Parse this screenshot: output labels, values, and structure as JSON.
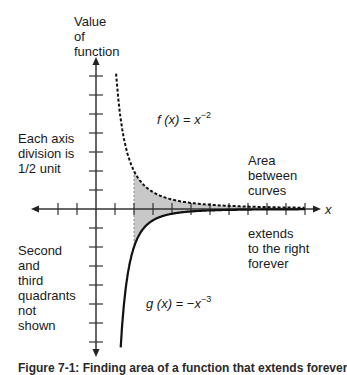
{
  "labels": {
    "y_axis_title": "Value\nof\nfunction",
    "scale_note": "Each axis\ndivision is\n1/2 unit",
    "area_note": "Area\nbetween\ncurves",
    "extends_note": "extends\nto the right\nforever",
    "quadrant_note": "Second\nand\nthird\nquadrants\nnot\nshown",
    "x_axis_label": "x",
    "f_label": {
      "name": "f",
      "arg": "(x)",
      "eq": " = ",
      "base": "x",
      "exp": "−2"
    },
    "g_label": {
      "name": "g",
      "arg": "(x)",
      "eq": " = −",
      "base": "x",
      "exp": "−3"
    },
    "caption": "Figure 7-1: Finding area of a function that extends forever"
  },
  "colors": {
    "axis": "#333333",
    "curve": "#111111",
    "shade": "#c8c8c8",
    "boundary": "#9a9a9a"
  },
  "chart_data": {
    "type": "line",
    "title": "",
    "xlabel": "x",
    "ylabel": "Value of function",
    "axis_division": 0.5,
    "xlim": [
      -1.5,
      6.0
    ],
    "ylim": [
      -3.5,
      3.5
    ],
    "grid": false,
    "series": [
      {
        "name": "f(x) = x^-2",
        "style": "dashed",
        "x": [
          0.45,
          0.5,
          0.6,
          0.75,
          1,
          1.5,
          2,
          3,
          4,
          5,
          5.5
        ],
        "y": [
          4.94,
          4.0,
          2.78,
          1.78,
          1.0,
          0.44,
          0.25,
          0.11,
          0.06,
          0.04,
          0.03
        ]
      },
      {
        "name": "g(x) = -x^-3",
        "style": "solid",
        "x": [
          0.26,
          0.3,
          0.4,
          0.5,
          0.75,
          1,
          1.5,
          2,
          3,
          4,
          5,
          5.5
        ],
        "y": [
          -3.7,
          -3.7,
          -3.5,
          -3.5,
          -2.37,
          -1.0,
          -0.3,
          -0.125,
          -0.037,
          -0.016,
          -0.008,
          -0.006
        ]
      }
    ],
    "shaded_region": {
      "description": "Area between curves",
      "x_start": 1,
      "x_end": "infinity"
    },
    "annotations": [
      "Each axis division is 1/2 unit",
      "Area between curves",
      "extends to the right forever",
      "Second and third quadrants not shown"
    ]
  }
}
